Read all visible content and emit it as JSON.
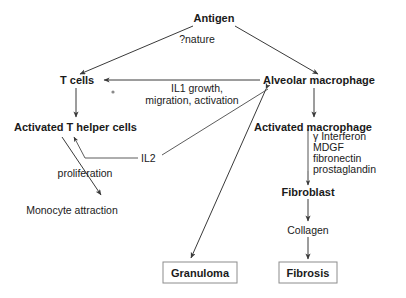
{
  "diagram": {
    "background_color": "#ffffff",
    "line_color": "#3a3a3a",
    "text_color": "#1a1a1a",
    "box_border_color": "#8c8c8c",
    "nodes": {
      "antigen": "Antigen",
      "antigen_note": "?nature",
      "t_cells": "T cells",
      "alveolar_macrophage": "Alveolar macrophage",
      "activated_t_helper_cells": "Activated T helper cells",
      "activated_macrophage": "Activated macrophage",
      "monocyte_attraction": "Monocyte attraction",
      "fibroblast": "Fibroblast",
      "collagen": "Collagen",
      "granuloma": "Granuloma",
      "fibrosis": "Fibrosis"
    },
    "edge_labels": {
      "il1_line1": "IL1 growth,",
      "il1_line2": "migration, activation",
      "il2": "IL2",
      "proliferation": "proliferation"
    },
    "mediators": {
      "heading": "",
      "items": [
        "γ Interferon",
        "MDGF",
        "fibronectin",
        "prostaglandin"
      ]
    }
  }
}
